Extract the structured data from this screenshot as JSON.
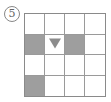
{
  "label": "5",
  "grid": {
    "rows": 4,
    "cols": 4,
    "shaded_color": "#9e9e9e",
    "marker_color": "#8c8c8c",
    "cells": [
      [
        {
          "shaded": false,
          "marker": ""
        },
        {
          "shaded": false,
          "marker": ""
        },
        {
          "shaded": false,
          "marker": ""
        },
        {
          "shaded": false,
          "marker": ""
        }
      ],
      [
        {
          "shaded": true,
          "marker": ""
        },
        {
          "shaded": false,
          "marker": "triangle-down"
        },
        {
          "shaded": true,
          "marker": ""
        },
        {
          "shaded": false,
          "marker": ""
        }
      ],
      [
        {
          "shaded": false,
          "marker": ""
        },
        {
          "shaded": false,
          "marker": ""
        },
        {
          "shaded": false,
          "marker": ""
        },
        {
          "shaded": false,
          "marker": ""
        }
      ],
      [
        {
          "shaded": true,
          "marker": ""
        },
        {
          "shaded": false,
          "marker": ""
        },
        {
          "shaded": false,
          "marker": ""
        },
        {
          "shaded": false,
          "marker": ""
        }
      ]
    ]
  }
}
